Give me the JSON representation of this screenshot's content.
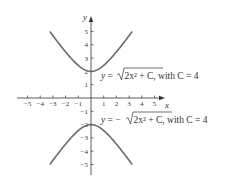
{
  "chart_data": {
    "type": "line",
    "title": "",
    "xlabel": "x",
    "ylabel": "y",
    "xlim": [
      -5.5,
      5.8
    ],
    "ylim": [
      -5.6,
      5.8
    ],
    "grid": false,
    "x_ticks": [
      -5,
      -4,
      -3,
      -2,
      -1,
      1,
      2,
      3,
      4,
      5
    ],
    "y_ticks": [
      -5,
      -4,
      -3,
      -2,
      -1,
      1,
      2,
      3,
      4,
      5
    ],
    "series": [
      {
        "name": "y = sqrt(2x^2 + C), with C = 4",
        "x": [
          -3.24,
          -3,
          -2.5,
          -2,
          -1.5,
          -1,
          -0.5,
          0,
          0.5,
          1,
          1.5,
          2,
          2.5,
          3,
          3.24
        ],
        "values": [
          5.0,
          4.69,
          4.06,
          3.46,
          2.92,
          2.45,
          2.12,
          2.0,
          2.12,
          2.45,
          2.92,
          3.46,
          4.06,
          4.69,
          5.0
        ]
      },
      {
        "name": "y = -sqrt(2x^2 + C), with C = 4",
        "x": [
          -3.24,
          -3,
          -2.5,
          -2,
          -1.5,
          -1,
          -0.5,
          0,
          0.5,
          1,
          1.5,
          2,
          2.5,
          3,
          3.24
        ],
        "values": [
          -5.0,
          -4.69,
          -4.06,
          -3.46,
          -2.92,
          -2.45,
          -2.12,
          -2.0,
          -2.12,
          -2.45,
          -2.92,
          -3.46,
          -4.06,
          -4.69,
          -5.0
        ]
      }
    ],
    "annotations": [
      {
        "text": "y = √(2x² + C), with C = 4",
        "near_series": 0
      },
      {
        "text": "y = −√(2x² + C), with C = 4",
        "near_series": 1
      }
    ]
  },
  "labels": {
    "x_axis": "x",
    "y_axis": "y",
    "upper": {
      "lhs": "y",
      "eq": " = ",
      "neg": "",
      "radicand": "2x² + C",
      "rest": ", with C = 4"
    },
    "lower": {
      "lhs": "y",
      "eq": " = ",
      "neg": "−",
      "radicand": "2x² + C",
      "rest": ", with C = 4"
    }
  },
  "colors": {
    "curve": "#6b6b6b",
    "axis": "#333333"
  }
}
